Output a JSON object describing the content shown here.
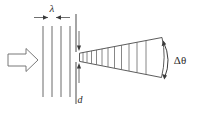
{
  "figure": {
    "width": 202,
    "height": 116,
    "background_color": "#ffffff",
    "line_color": "#4a4a4a"
  },
  "labels": {
    "wavelength": "λ",
    "slit_width": "d",
    "angular_spread": "Δθ"
  },
  "elements": {
    "incoming_beam_arrow": "hollow-block-arrow-right",
    "wavefront_count": 4,
    "cone_rib_count": 11,
    "slit_marker": "gap-in-vertical-barrier",
    "angle_arc": "curved-double-headed-arc"
  },
  "geometry": {
    "wavefront_x": [
      43,
      52,
      61,
      70
    ],
    "wavefront_top_y": 25,
    "wavefront_bottom_y": 98,
    "barrier_x": 76,
    "slit_top_y": 52,
    "slit_bottom_y": 62,
    "cone_apex_x": 79,
    "cone_far_x": 163,
    "cone_far_top_y": 38,
    "cone_far_bottom_y": 76,
    "lambda_dim_y": 17,
    "lambda_dim_left_x": 34,
    "lambda_dim_right_x": 70,
    "d_arrow_x": 79,
    "d_label_x": 80,
    "d_label_y": 100,
    "theta_label_x": 179,
    "theta_label_y": 61
  }
}
